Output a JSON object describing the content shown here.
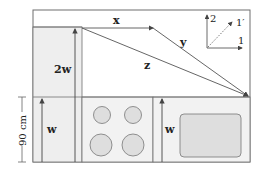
{
  "labels": {
    "x": "x",
    "y": "y",
    "z": "z",
    "two_w": "2w",
    "w_left": "w",
    "w_right": "w",
    "dimension": "90 cm",
    "axis_2": "2",
    "axis_1": "1",
    "axis_1prime": "1′"
  },
  "colors": {
    "outline": "#6e6e6e",
    "panel_fill": "#eeeeee",
    "burner_fill": "#dedede",
    "arrow": "#444444"
  },
  "burners": [
    "top-left",
    "top-right",
    "bottom-left",
    "bottom-right"
  ]
}
